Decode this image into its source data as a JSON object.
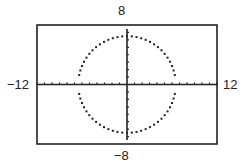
{
  "window": {
    "xmin": "-12",
    "xmax": "12",
    "ymin": "-8",
    "ymax": "8"
  },
  "chart_data": {
    "type": "scatter",
    "title": "",
    "xlabel": "",
    "ylabel": "",
    "xlim": [
      -12,
      12
    ],
    "ylim": [
      -8,
      8
    ],
    "xtick_step": 1,
    "ytick_step": 1,
    "grid": false,
    "tick_labels": {
      "left": "-12",
      "right": "12",
      "top": "8",
      "bottom": "-8"
    },
    "series": [
      {
        "name": "circle",
        "shape": "circle",
        "center": [
          0,
          0
        ],
        "radius": 6.5,
        "style": "dotted",
        "gaps_at_x_axis": true
      }
    ]
  }
}
